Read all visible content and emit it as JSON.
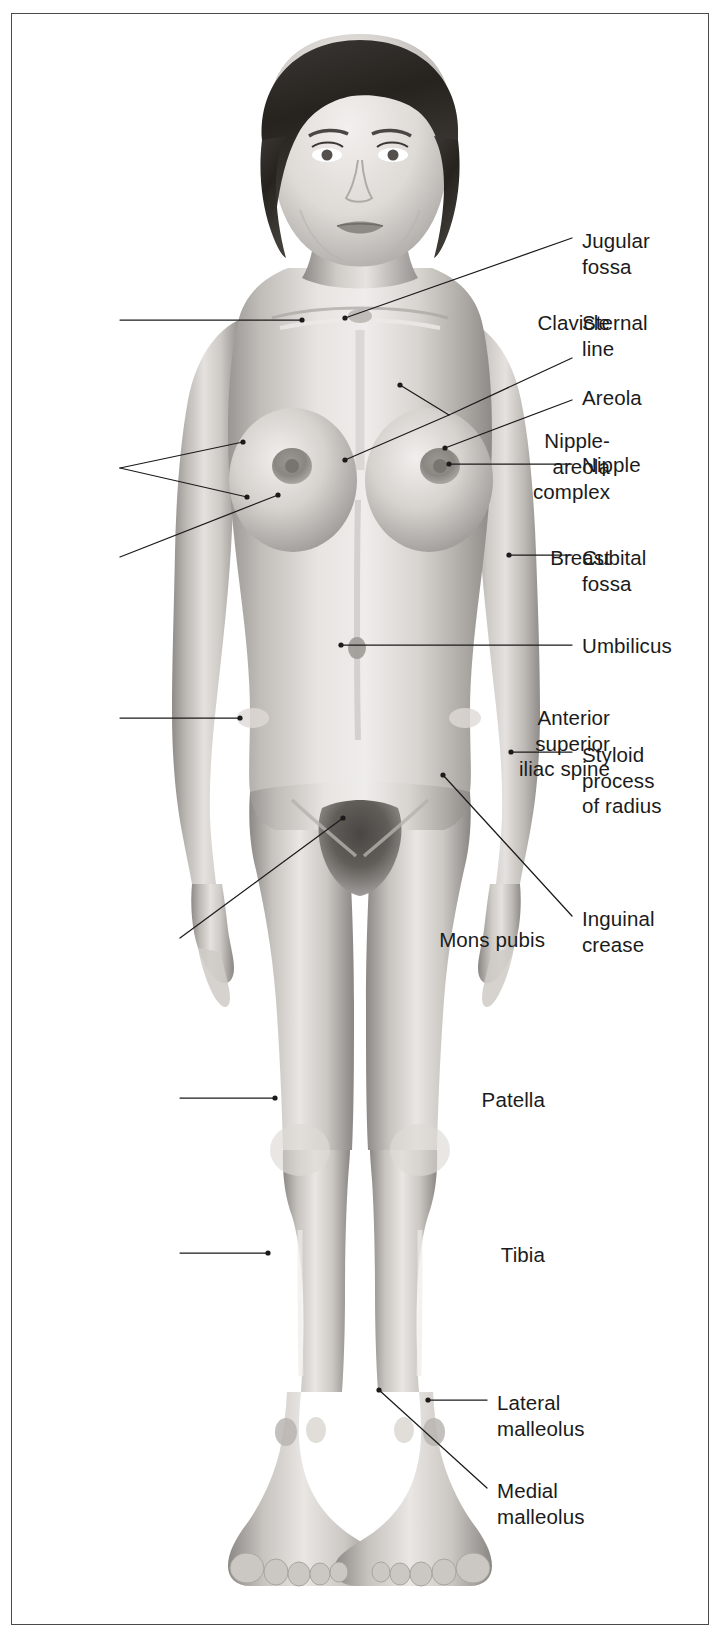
{
  "plate": {
    "view": "anterior",
    "subject": "adult female surface anatomy",
    "frame_color": "#4a4a4a",
    "background_color": "#ffffff",
    "label_color": "#1b1b1b",
    "leader_color": "#1b1b1b"
  },
  "labels_right": [
    {
      "id": "jugular-fossa",
      "text": "Jugular\nfossa",
      "x": 582,
      "y": 228
    },
    {
      "id": "sternal-line",
      "text": "Sternal\nline",
      "x": 582,
      "y": 310
    },
    {
      "id": "areola",
      "text": "Areola",
      "x": 582,
      "y": 385
    },
    {
      "id": "nipple",
      "text": "Nipple",
      "x": 582,
      "y": 452
    },
    {
      "id": "cubital-fossa",
      "text": "Cubital\nfossa",
      "x": 582,
      "y": 545
    },
    {
      "id": "umbilicus",
      "text": "Umbilicus",
      "x": 582,
      "y": 633
    },
    {
      "id": "styloid-process",
      "text": "Styloid\nprocess\nof radius",
      "x": 582,
      "y": 742
    },
    {
      "id": "inguinal-crease",
      "text": "Inguinal\ncrease",
      "x": 582,
      "y": 906
    },
    {
      "id": "lateral-malleolus",
      "text": "Lateral\nmalleolus",
      "x": 497,
      "y": 1390
    },
    {
      "id": "medial-malleolus",
      "text": "Medial\nmalleolus",
      "x": 497,
      "y": 1478
    }
  ],
  "labels_left": [
    {
      "id": "clavicle",
      "text": "Clavicle",
      "right": 610,
      "y": 310
    },
    {
      "id": "nipple-areola-complex",
      "text": "Nipple-\nareola\ncomplex",
      "right": 610,
      "y": 428
    },
    {
      "id": "breast",
      "text": "Breast",
      "right": 610,
      "y": 545
    },
    {
      "id": "anterior-superior-iliac-spine",
      "text": "Anterior\nsuperior\niliac spine",
      "right": 610,
      "y": 705
    },
    {
      "id": "mons-pubis",
      "text": "Mons pubis",
      "right": 545,
      "y": 927
    },
    {
      "id": "patella",
      "text": "Patella",
      "right": 545,
      "y": 1087
    },
    {
      "id": "tibia",
      "text": "Tibia",
      "right": 545,
      "y": 1242
    }
  ],
  "leaders": [
    {
      "id": "leader-jugular-fossa",
      "points": "572,238 345,318"
    },
    {
      "id": "leader-sternal-line",
      "points": "572,358 449,415 400,385 400,385"
    },
    {
      "id": "leader-sternal-branch",
      "points": "449,415 345,460"
    },
    {
      "id": "leader-areola",
      "points": "572,400 445,448"
    },
    {
      "id": "leader-nipple",
      "points": "572,464 449,464"
    },
    {
      "id": "leader-cubital-fossa",
      "points": "572,555 509,555"
    },
    {
      "id": "leader-umbilicus",
      "points": "572,645 341,645"
    },
    {
      "id": "leader-styloid-process",
      "points": "572,752 511,752"
    },
    {
      "id": "leader-inguinal-crease",
      "points": "572,916 443,775"
    },
    {
      "id": "leader-lateral-malleolus",
      "points": "487,1400 428,1400"
    },
    {
      "id": "leader-medial-malleolus",
      "points": "487,1488 379,1390"
    },
    {
      "id": "leader-clavicle",
      "points": "120,320 302,320"
    },
    {
      "id": "leader-nipple-areola-top",
      "points": "120,468 243,442"
    },
    {
      "id": "leader-nipple-areola-bot",
      "points": "120,468 247,497"
    },
    {
      "id": "leader-breast",
      "points": "120,557 278,495"
    },
    {
      "id": "leader-asis",
      "points": "120,718 240,718"
    },
    {
      "id": "leader-mons-pubis",
      "points": "180,938 343,818"
    },
    {
      "id": "leader-patella",
      "points": "180,1098 275,1098"
    },
    {
      "id": "leader-tibia",
      "points": "180,1253 268,1253"
    }
  ],
  "figure": {
    "skin_light": "#f0eeec",
    "skin_mid": "#c9c5c1",
    "skin_dark": "#9b9794",
    "shadow": "#6f6b68",
    "hair_dark": "#2e2b29",
    "hair_mid": "#4f4b48"
  }
}
